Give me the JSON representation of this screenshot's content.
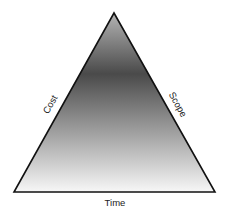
{
  "diagram": {
    "type": "project-management-triangle",
    "labels": {
      "left": "Cost",
      "right": "Scope",
      "bottom": "Time"
    },
    "colors": {
      "stroke": "#111111",
      "gradient_top": "#b4b4b4",
      "gradient_dark": "#4a4a4a",
      "gradient_bottom": "#f7f7f7"
    }
  }
}
